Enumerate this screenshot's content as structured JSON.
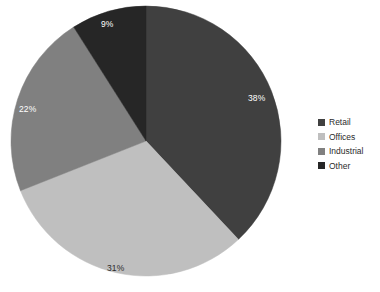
{
  "chart_data": {
    "type": "pie",
    "title": "",
    "categories": [
      "Retail",
      "Offices",
      "Industrial",
      "Other"
    ],
    "values": [
      38,
      31,
      22,
      9
    ],
    "value_labels": [
      "38%",
      "31%",
      "22%",
      "9%"
    ],
    "colors": [
      "#404040",
      "#bfbfbf",
      "#808080",
      "#262626"
    ],
    "label_text_colors": [
      "#ffffff",
      "#2b2b2b",
      "#ffffff",
      "#ffffff"
    ],
    "legend_position": "right",
    "start_angle_deg": 0,
    "direction": "clockwise",
    "grid": false,
    "units": "percent"
  },
  "legend": {
    "items": [
      {
        "label": "Retail",
        "color": "#404040"
      },
      {
        "label": "Offices",
        "color": "#bfbfbf"
      },
      {
        "label": "Industrial",
        "color": "#808080"
      },
      {
        "label": "Other",
        "color": "#262626"
      }
    ]
  },
  "geometry": {
    "center_x": 146,
    "center_y": 141,
    "radius": 135
  },
  "labels": {
    "retail": {
      "text": "38%",
      "x": 248,
      "y": 93
    },
    "offices": {
      "text": "31%",
      "x": 107,
      "y": 263
    },
    "industrial": {
      "text": "22%",
      "x": 19,
      "y": 104
    },
    "other": {
      "text": "9%",
      "x": 101,
      "y": 19
    }
  }
}
